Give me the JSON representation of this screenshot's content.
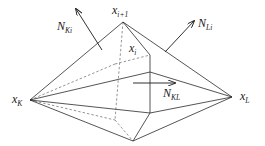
{
  "diagram": {
    "type": "polyhedral dual cell (double pyramid) around edge x_K–x_L",
    "colors": {
      "edge": "#2a2a2a",
      "hidden_edge": "#7a7a7a",
      "background": "#ffffff"
    },
    "labels": {
      "x_k": {
        "base": "x",
        "sub": "K"
      },
      "x_l": {
        "base": "x",
        "sub": "L"
      },
      "x_ip1": {
        "base": "x",
        "sub": "i+1"
      },
      "x_i": {
        "base": "x",
        "sub": "i"
      },
      "n_ki": {
        "base": "N",
        "sub": "Ki"
      },
      "n_li": {
        "base": "N",
        "sub": "Li"
      },
      "n_kl": {
        "base": "N",
        "sub": "KL"
      }
    },
    "vertices": {
      "x_k": [
        30,
        100
      ],
      "x_l": [
        232,
        97
      ],
      "x_ip1": [
        123,
        22
      ],
      "x_i": [
        150,
        55
      ],
      "front_lower": [
        150,
        113
      ],
      "bottom": [
        133,
        141
      ],
      "back_upper": [
        115,
        64
      ],
      "back_lower": [
        115,
        120
      ]
    }
  }
}
